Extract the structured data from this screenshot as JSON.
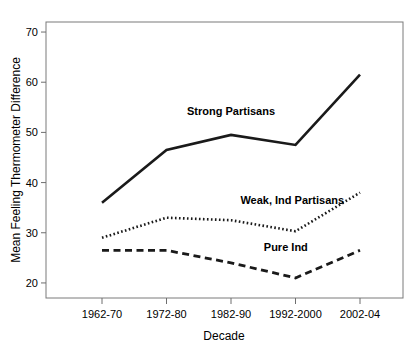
{
  "chart_data": {
    "type": "line",
    "title": "",
    "xlabel": "Decade",
    "ylabel": "Mean Feeling Thermometer Difference",
    "categories": [
      "1962-70",
      "1972-80",
      "1982-90",
      "1992-2000",
      "2002-04"
    ],
    "ylim": [
      17,
      72
    ],
    "yticks": [
      20,
      30,
      40,
      50,
      60,
      70
    ],
    "ytick_labels": [
      "20",
      "30",
      "40",
      "50",
      "60",
      "70"
    ],
    "grid": false,
    "legend_position": "inline-annotations",
    "series": [
      {
        "name": "Strong Partisans",
        "style": "solid",
        "color": "#1a1a1a",
        "values": [
          36,
          46.5,
          49.5,
          47.5,
          61.5
        ]
      },
      {
        "name": "Weak, Ind Partisans",
        "style": "dotted",
        "color": "#1a1a1a",
        "values": [
          29,
          33,
          32.5,
          30.3,
          38
        ]
      },
      {
        "name": "Pure Ind",
        "style": "dashed",
        "color": "#1a1a1a",
        "values": [
          26.5,
          26.5,
          24,
          21,
          26.5
        ]
      }
    ],
    "annotations": [
      {
        "text": "Strong Partisans",
        "x": 2.0,
        "y": 53.5
      },
      {
        "text": "Weak, Ind Partisans",
        "x": 2.95,
        "y": 35.8
      },
      {
        "text": "Pure Ind",
        "x": 2.85,
        "y": 26.3
      }
    ]
  }
}
